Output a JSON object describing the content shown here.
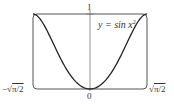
{
  "chart_data": {
    "type": "line",
    "title": "",
    "equation_label": "y = sin x²",
    "xlabel": "",
    "ylabel": "",
    "xlim": [
      -1.2533,
      1.2533
    ],
    "ylim": [
      0,
      1
    ],
    "x_tick_labels": [
      "-√(π/2)",
      "0",
      "√(π/2)"
    ],
    "y_tick_labels": [
      "1"
    ],
    "grid": false,
    "legend": null,
    "series": [
      {
        "name": "y = sin x²",
        "function": "sin(x^2)",
        "x": [
          -1.2533,
          -1.0,
          -0.75,
          -0.5,
          -0.25,
          0,
          0.25,
          0.5,
          0.75,
          1.0,
          1.2533
        ],
        "y": [
          1.0,
          0.8415,
          0.5333,
          0.2474,
          0.0625,
          0.0,
          0.0625,
          0.2474,
          0.5333,
          0.8415,
          1.0
        ]
      }
    ],
    "frame": "rounded-rectangle viewing window"
  },
  "labels": {
    "top_tick": "1",
    "origin": "0",
    "left_bound_prefix": "−√",
    "left_bound_rad": "π/2",
    "right_bound_prefix": "√",
    "right_bound_rad": "π/2",
    "equation_main": "y = sin x",
    "equation_sup": "2"
  }
}
